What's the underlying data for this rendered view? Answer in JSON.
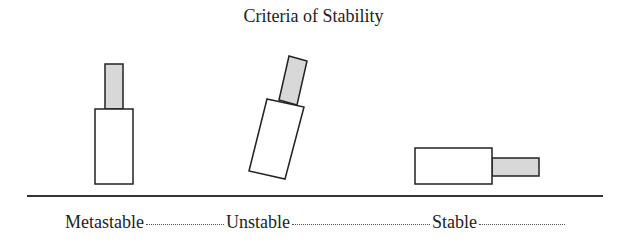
{
  "title": "Criteria of Stability",
  "colors": {
    "stroke": "#222222",
    "shaded_fill": "#d8d8d8",
    "body_fill": "#ffffff",
    "ground": "#333333"
  },
  "ground_line": {
    "x1": 27,
    "x2": 603,
    "y": 196
  },
  "states": [
    {
      "label": "Metastable",
      "dots_width": 78,
      "body": "95,109 133,109 133,184 95,184",
      "top": "105,64 123,64 123,109 105,109"
    },
    {
      "label": "Unstable",
      "dots_width": 138,
      "body": "267,99 304,107 285,179 249,171",
      "top": "289,56 307,61 297,105 279,100"
    },
    {
      "label": "Stable",
      "dots_width": 86,
      "body": "415,148 492,148 492,184 415,184",
      "top": "492,158 539,158 539,176 492,176"
    }
  ]
}
